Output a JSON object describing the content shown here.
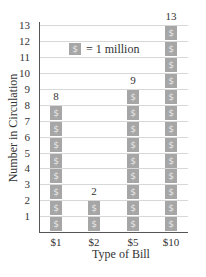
{
  "chart_data": {
    "type": "bar",
    "subtype": "pictograph",
    "categories": [
      "$1",
      "$2",
      "$5",
      "$10"
    ],
    "values": [
      8,
      2,
      9,
      13
    ],
    "data_labels": [
      "8",
      "2",
      "9",
      "13"
    ],
    "title": "",
    "xlabel": "Type of Bill",
    "ylabel": "Number in Circulation",
    "ylim": [
      0,
      13
    ],
    "yticks": [
      1,
      2,
      3,
      4,
      5,
      6,
      7,
      8,
      9,
      10,
      11,
      12,
      13
    ],
    "grid": true,
    "legend": {
      "symbol": "$",
      "text": "= 1 million",
      "position": "upper-left inside plot"
    },
    "bar_color": "#a6a6a6"
  },
  "symbol": "$",
  "legend_text": "= 1 million",
  "xlabel": "Type of Bill",
  "ylabel": "Number in Circulation",
  "yticks": [
    "1",
    "2",
    "3",
    "4",
    "5",
    "6",
    "7",
    "8",
    "9",
    "10",
    "11",
    "12",
    "13"
  ],
  "bars": [
    {
      "label": "$1",
      "value": "8"
    },
    {
      "label": "$2",
      "value": "2"
    },
    {
      "label": "$5",
      "value": "9"
    },
    {
      "label": "$10",
      "value": "13"
    }
  ]
}
